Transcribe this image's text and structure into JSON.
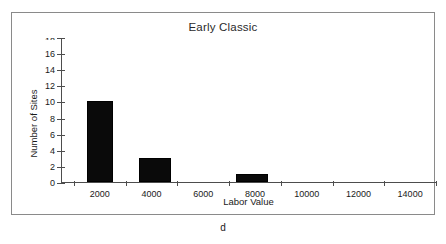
{
  "figure": {
    "caption": "d",
    "frame_color": "#8a8a8a",
    "background": "#ffffff"
  },
  "chart_data": {
    "type": "bar",
    "title": "Early Classic",
    "xlabel": "Labor Value",
    "ylabel": "Number of Sites",
    "bar_color": "#0a0a0a",
    "grid": false,
    "legend": null,
    "xlim": [
      500,
      15000
    ],
    "ylim": [
      0,
      18
    ],
    "x_tick_labels": [
      "2000",
      "4000",
      "6000",
      "8000",
      "10000",
      "12000",
      "14000"
    ],
    "x_tick_values": [
      2000,
      4000,
      6000,
      8000,
      10000,
      12000,
      14000
    ],
    "x_minor_tick_values": [
      1000,
      3000,
      5000,
      7000,
      9000,
      11000,
      13000,
      15000
    ],
    "y_tick_labels": [
      "0",
      "2",
      "4",
      "6",
      "8",
      "10",
      "12",
      "14",
      "16",
      "18"
    ],
    "y_tick_values": [
      0,
      2,
      4,
      6,
      8,
      10,
      12,
      14,
      16,
      18
    ],
    "bins": [
      {
        "label": "1500-2500",
        "start": 1500,
        "end": 2500,
        "value": 10
      },
      {
        "label": "3500-4750",
        "start": 3500,
        "end": 4750,
        "value": 3
      },
      {
        "label": "7250-8500",
        "start": 7250,
        "end": 8500,
        "value": 1
      }
    ],
    "categories": [
      "1500-2500",
      "3500-4750",
      "7250-8500"
    ],
    "values": [
      10,
      3,
      1
    ]
  }
}
